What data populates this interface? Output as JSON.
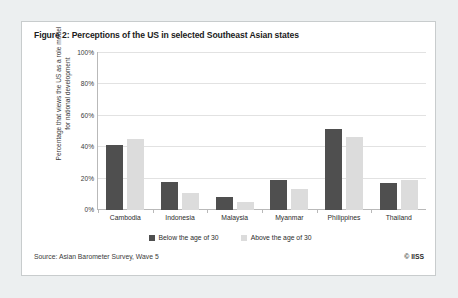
{
  "figure": {
    "title": "Figure 2: Perceptions of the US in selected Southeast Asian states",
    "source": "Source: Asian Barometer Survey, Wave 5",
    "copyright": "© IISS"
  },
  "colors": {
    "below30": "#4f4f4f",
    "above30": "#dcdcdc",
    "grid": "#e2e2e2",
    "axis": "#b9b9b9",
    "card_background": "#ffffff",
    "page_background": "#eceff0",
    "card_border": "#c8cccd"
  },
  "chart_data": {
    "type": "bar",
    "title": "Figure 2: Perceptions of the US in selected Southeast Asian states",
    "xlabel": "",
    "ylabel": "Percentage that views the US as a role model for national development",
    "categories": [
      "Cambodia",
      "Indonesia",
      "Malaysia",
      "Myanmar",
      "Philippines",
      "Thailand"
    ],
    "series": [
      {
        "name": "Below the age of 30",
        "values": [
          41,
          18,
          8,
          19,
          51,
          17
        ]
      },
      {
        "name": "Above the age of 30",
        "values": [
          45,
          11,
          5,
          13,
          46,
          19
        ]
      }
    ],
    "ylim": [
      0,
      100
    ],
    "yticks": [
      100,
      80,
      60,
      40,
      20,
      0
    ],
    "ytick_labels": [
      "100%",
      "80%",
      "60%",
      "40%",
      "20%",
      "0%"
    ],
    "grid": true,
    "legend_position": "bottom"
  }
}
